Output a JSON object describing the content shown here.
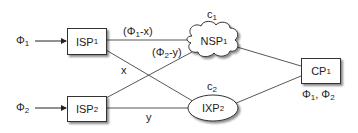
{
  "diagram": {
    "nodes": {
      "isp1": {
        "name": "ISP",
        "sub": "1",
        "shape": "rectangle"
      },
      "isp2": {
        "name": "ISP",
        "sub": "2",
        "shape": "rectangle"
      },
      "nsp1": {
        "name": "NSP",
        "sub": "1",
        "shape": "cloud",
        "cost_name": "c",
        "cost_sub": "1"
      },
      "ixp2": {
        "name": "IXP",
        "sub": "2",
        "shape": "ellipse",
        "cost_name": "c",
        "cost_sub": "2"
      },
      "cp1": {
        "name": "CP",
        "sub": "1",
        "shape": "rectangle"
      }
    },
    "inputs": {
      "phi1": {
        "sym": "Φ",
        "sub": "1"
      },
      "phi2": {
        "sym": "Φ",
        "sub": "2"
      }
    },
    "edge_labels": {
      "isp1_nsp1": {
        "pre": "(Φ",
        "sub": "1",
        "post": "-x)"
      },
      "isp2_nsp1": {
        "pre": "(Φ",
        "sub": "2",
        "post": "-y)"
      },
      "isp1_ixp2": "x",
      "isp2_ixp2": "y"
    },
    "cp_label": {
      "a": "Φ",
      "a_sub": "1",
      "sep": ", ",
      "b": "Φ",
      "b_sub": "2"
    },
    "colors": {
      "line": "#444444",
      "stroke": "#333333",
      "fill": "#ffffff"
    }
  }
}
